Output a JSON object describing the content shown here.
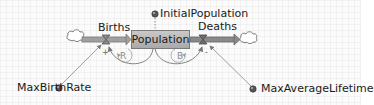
{
  "diagram": {
    "type": "stock-and-flow",
    "stock": {
      "name": "Population"
    },
    "flows": [
      {
        "name": "Births",
        "direction": "inflow",
        "source": "cloud"
      },
      {
        "name": "Deaths",
        "direction": "outflow",
        "sink": "cloud"
      }
    ],
    "auxiliaries": [
      {
        "name": "InitialPopulation"
      },
      {
        "name": "MaxBirthRate"
      },
      {
        "name": "MaxAverageLifetime"
      }
    ],
    "loops": [
      {
        "label": "R",
        "meaning": "reinforcing"
      },
      {
        "label": "B",
        "meaning": "balancing"
      }
    ],
    "polarities": {
      "births_link": "+",
      "deaths_link": "-"
    },
    "colors": {
      "pipe": "#8c8c8c",
      "stock_fill": "#b8b8b8",
      "link": "#8a8a8a",
      "text": "#1a1a1a"
    }
  }
}
